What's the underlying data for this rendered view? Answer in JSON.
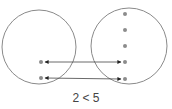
{
  "diagram": {
    "caption": "2 < 5",
    "colors": {
      "circle": "#8a8a8a",
      "dot": "#8c8c8c",
      "arrow": "#333333"
    },
    "sets": [
      {
        "name": "left-set",
        "count": 2
      },
      {
        "name": "right-set",
        "count": 5
      }
    ],
    "mappings": [
      {
        "from": "left-1",
        "to": "right-4"
      },
      {
        "from": "left-2",
        "to": "right-5"
      }
    ]
  }
}
